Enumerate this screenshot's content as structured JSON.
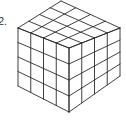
{
  "figure": {
    "label": "2.",
    "grid": {
      "rows": 4,
      "cols": 4,
      "depth": 4
    },
    "line_color": "#2a2a2a",
    "background": "#ffffff",
    "vertices": {
      "top": [
        61,
        1
      ],
      "left": [
        18,
        28
      ],
      "right": [
        120,
        28
      ],
      "front_top": [
        69,
        48
      ],
      "left_bottom": [
        18,
        86
      ],
      "right_bottom": [
        120,
        76
      ],
      "bottom": [
        69,
        112
      ]
    }
  }
}
